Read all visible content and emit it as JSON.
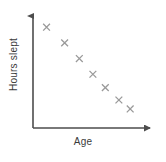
{
  "chart_data": {
    "type": "scatter",
    "title": "",
    "xlabel": "Age",
    "ylabel": "Hours slept",
    "grid": false,
    "legend": null,
    "xlim": [
      0,
      10
    ],
    "ylim": [
      0,
      10
    ],
    "axis_ticks": false,
    "marker": "x",
    "marker_color": "#9a9a9a",
    "axis_color": "#4d4d4d",
    "label_color": "#3b3b3b",
    "series": [
      {
        "name": "Hours slept vs Age",
        "points": [
          {
            "x": 1.2,
            "y": 9.0
          },
          {
            "x": 2.8,
            "y": 7.6
          },
          {
            "x": 4.1,
            "y": 6.2
          },
          {
            "x": 5.3,
            "y": 4.8
          },
          {
            "x": 6.4,
            "y": 3.6
          },
          {
            "x": 7.6,
            "y": 2.5
          },
          {
            "x": 8.6,
            "y": 1.7
          }
        ]
      }
    ]
  },
  "axes": {
    "x_label": "Age",
    "y_label": "Hours slept"
  }
}
